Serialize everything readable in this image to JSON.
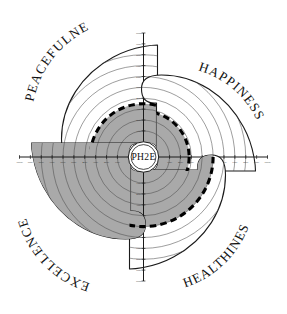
{
  "chart_data": {
    "type": "radar",
    "title": "PH2E",
    "center_label": "PH2E",
    "categories": [
      "PEACEFULNESS",
      "HAPPINESS",
      "HEALTHINESS",
      "EXCELLENCE"
    ],
    "values": [
      35,
      28,
      50,
      95
    ],
    "ylim": [
      0,
      100
    ],
    "tick_labels": [
      "10%",
      "20%",
      "30%",
      "40%",
      "50%",
      "60%",
      "70%",
      "80%",
      "90%",
      "100%"
    ],
    "tick_values": [
      10,
      20,
      30,
      40,
      50,
      60,
      70,
      80,
      90,
      100
    ],
    "grid": true,
    "legend": "none",
    "xlabel": "",
    "ylabel": "",
    "series": [
      {
        "name": "PH2E",
        "values": [
          35,
          28,
          50,
          95
        ]
      }
    ],
    "colors": {
      "fill": "#a9a9a9",
      "outline": "#1a1a1a",
      "boundary": "#000000",
      "grid": "#4d4d4d",
      "background": "#ffffff"
    }
  },
  "hub": {
    "label": "PH2E"
  },
  "petals": [
    {
      "id": "peacefulness",
      "label": "PEACEFULNESS",
      "value": 35,
      "axis_tick_labels": [
        "10%",
        "20%",
        "30%",
        "40%",
        "50%",
        "60%",
        "70%",
        "80%",
        "90%",
        "100%"
      ]
    },
    {
      "id": "happiness",
      "label": "HAPPINESS",
      "value": 28,
      "axis_tick_labels": [
        "10%",
        "20%",
        "30%",
        "40%",
        "50%",
        "60%",
        "70%",
        "80%",
        "90%",
        "100%"
      ]
    },
    {
      "id": "healthiness",
      "label": "HEALTHINESS",
      "value": 50,
      "axis_tick_labels": [
        "10%",
        "20%",
        "30%",
        "40%",
        "50%",
        "60%",
        "70%",
        "80%",
        "90%",
        "100%"
      ]
    },
    {
      "id": "excellence",
      "label": "EXCELLENCE",
      "value": 95,
      "axis_tick_labels": [
        "10%",
        "20%",
        "30%",
        "40%",
        "50%",
        "60%",
        "70%",
        "80%",
        "90%",
        "100%"
      ]
    }
  ]
}
